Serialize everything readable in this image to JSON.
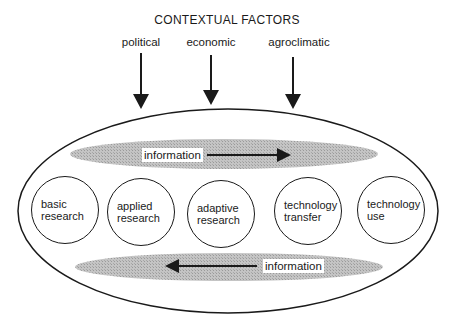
{
  "title": "CONTEXTUAL FACTORS",
  "factors": [
    {
      "label": "political",
      "x": 141
    },
    {
      "label": "economic",
      "x": 211
    },
    {
      "label": "agroclimatic",
      "x": 293
    }
  ],
  "nodes": [
    {
      "label": "basic research"
    },
    {
      "label": "applied research"
    },
    {
      "label": "adaptive research"
    },
    {
      "label": "technology transfer"
    },
    {
      "label": "technology use"
    }
  ],
  "information_flows": [
    {
      "label": "information",
      "direction": "right"
    },
    {
      "label": "information",
      "direction": "left"
    }
  ],
  "colors": {
    "line": "#1a1a1a",
    "band": "#b8b8b8"
  }
}
